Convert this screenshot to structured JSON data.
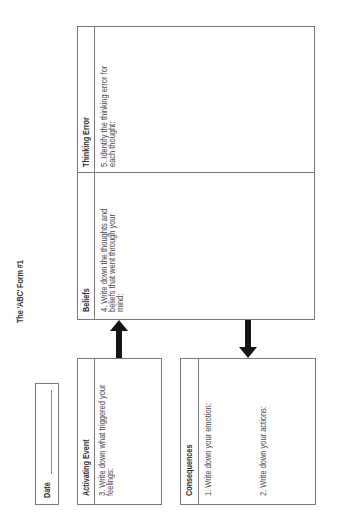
{
  "document": {
    "title": "The 'ABC' Form #1",
    "orientation": "rotated 90deg counter-clockwise",
    "colors": {
      "border": "#7a7a7a",
      "text": "#3a3a3a",
      "arrow": "#151515",
      "background": "#ffffff"
    }
  },
  "date_field": {
    "label": "Date",
    "value": ""
  },
  "sections": {
    "activating_event": {
      "heading": "Activating Event",
      "prompt": "3. Write down what triggered your feelings:"
    },
    "consequences": {
      "heading": "Consequences",
      "prompt_emotion": "1. Write down your emotion:",
      "prompt_actions": "2. Write down your actions:"
    },
    "beliefs": {
      "heading": "Beliefs",
      "prompt": "4. Write down the thoughts and beliefs that went through your mind:"
    },
    "thinking_error": {
      "heading": "Thinking Error",
      "prompt": "5. Identify the thinking error for each thought:"
    }
  },
  "arrows": [
    {
      "from": "activating_event",
      "to": "beliefs",
      "icon": "arrow-right-icon"
    },
    {
      "from": "beliefs",
      "to": "consequences",
      "icon": "arrow-left-icon"
    }
  ]
}
